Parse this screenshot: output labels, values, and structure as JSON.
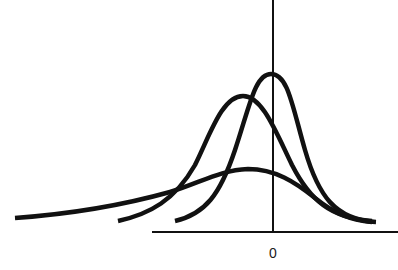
{
  "diagram": {
    "axis": {
      "x_tick_label": "0",
      "colors": {
        "stroke": "#111111",
        "background": "#ffffff"
      }
    },
    "curves": [
      {
        "name": "wide-flat-curve",
        "peak_relative_position": "slightly left of 0",
        "spread": "wide"
      },
      {
        "name": "medium-curve",
        "peak_relative_position": "left of 0",
        "spread": "medium"
      },
      {
        "name": "narrow-tall-curve",
        "peak_relative_position": "at 0",
        "spread": "narrow"
      }
    ]
  }
}
